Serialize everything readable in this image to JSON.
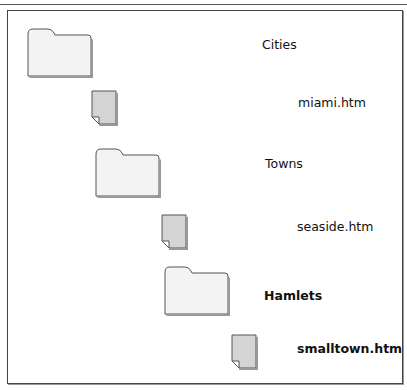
{
  "diagram": {
    "title_clipped": "",
    "items": [
      {
        "type": "folder",
        "label": "Cities",
        "bold": false,
        "icon": "folder-icon"
      },
      {
        "type": "file",
        "label": "miami.htm",
        "bold": false,
        "icon": "file-icon"
      },
      {
        "type": "folder",
        "label": "Towns",
        "bold": false,
        "icon": "folder-icon"
      },
      {
        "type": "file",
        "label": "seaside.htm",
        "bold": false,
        "icon": "file-icon"
      },
      {
        "type": "folder",
        "label": "Hamlets",
        "bold": true,
        "icon": "folder-icon"
      },
      {
        "type": "file",
        "label": "smalltown.htm",
        "bold": true,
        "icon": "file-icon"
      }
    ]
  }
}
